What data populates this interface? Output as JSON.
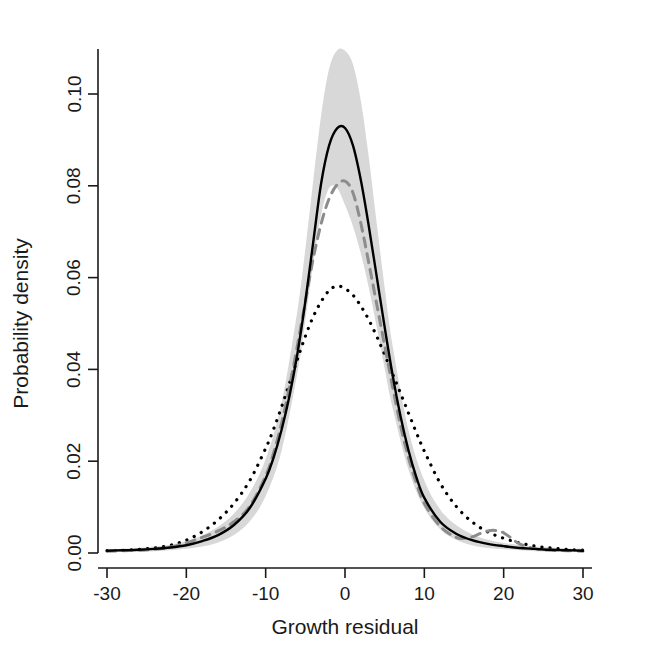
{
  "chart_data": {
    "type": "line",
    "title": "",
    "xlabel": "Growth residual",
    "ylabel": "Probability density",
    "xlim": [
      -31.5,
      31.5
    ],
    "ylim": [
      -0.0015,
      0.1125
    ],
    "xticks": [
      -30,
      -20,
      -10,
      0,
      10,
      20,
      30
    ],
    "xtick_labels": [
      "-30",
      "-20",
      "-10",
      "0",
      "10",
      "20",
      "30"
    ],
    "yticks": [
      0.0,
      0.02,
      0.04,
      0.06,
      0.08,
      0.1
    ],
    "ytick_labels": [
      "0.00",
      "0.02",
      "0.04",
      "0.06",
      "0.08",
      "0.10"
    ],
    "grid": false,
    "legend": "none",
    "colors": {
      "band": "#d8d8d8",
      "solid_line": "#000000",
      "dashed_line": "#8c8c8c",
      "dotted_line": "#000000",
      "axis": "#1a1a1a"
    },
    "series": [
      {
        "name": "confidence band upper",
        "style": "band-upper",
        "x": [
          -30,
          -28,
          -26,
          -24,
          -22,
          -20,
          -18,
          -16,
          -14,
          -12,
          -10,
          -8,
          -6,
          -5,
          -4,
          -3,
          -2,
          -1,
          0,
          1,
          2,
          3,
          4,
          5,
          6,
          8,
          10,
          12,
          14,
          16,
          18,
          20,
          22,
          24,
          26,
          28,
          30
        ],
        "values": [
          0.0008,
          0.0009,
          0.0011,
          0.0014,
          0.0018,
          0.0026,
          0.0038,
          0.0057,
          0.0086,
          0.0132,
          0.0205,
          0.0326,
          0.0528,
          0.0662,
          0.0812,
          0.0955,
          0.1055,
          0.1095,
          0.1094,
          0.1065,
          0.0985,
          0.0862,
          0.0718,
          0.0578,
          0.0452,
          0.0268,
          0.0158,
          0.0095,
          0.0061,
          0.0041,
          0.0029,
          0.0022,
          0.0017,
          0.0014,
          0.0012,
          0.001,
          0.0009
        ]
      },
      {
        "name": "confidence band lower",
        "style": "band-lower",
        "x": [
          -30,
          -28,
          -26,
          -24,
          -22,
          -20,
          -18,
          -16,
          -14,
          -12,
          -10,
          -8,
          -6,
          -5,
          -4,
          -3,
          -2,
          -1,
          0,
          1,
          2,
          3,
          4,
          5,
          6,
          8,
          10,
          12,
          14,
          16,
          18,
          20,
          22,
          24,
          26,
          28,
          30
        ],
        "values": [
          0.0002,
          0.0002,
          0.0003,
          0.0004,
          0.0006,
          0.0009,
          0.0014,
          0.0023,
          0.0039,
          0.0069,
          0.0124,
          0.0222,
          0.0392,
          0.0507,
          0.0632,
          0.0738,
          0.0795,
          0.0795,
          0.0758,
          0.0712,
          0.0652,
          0.0578,
          0.0492,
          0.0402,
          0.0316,
          0.0182,
          0.0098,
          0.0052,
          0.0029,
          0.0017,
          0.0011,
          0.0008,
          0.0006,
          0.0004,
          0.0003,
          0.0003,
          0.0002
        ]
      },
      {
        "name": "fitted density (solid)",
        "style": "solid",
        "x": [
          -30,
          -28,
          -26,
          -24,
          -22,
          -20,
          -18,
          -16,
          -14,
          -12,
          -10,
          -9,
          -8,
          -7,
          -6,
          -5,
          -4,
          -3,
          -2,
          -1,
          0,
          1,
          2,
          3,
          4,
          5,
          6,
          7,
          8,
          9,
          10,
          12,
          14,
          16,
          18,
          20,
          22,
          24,
          26,
          28,
          30
        ],
        "values": [
          0.0005,
          0.0006,
          0.0007,
          0.0009,
          0.0012,
          0.0017,
          0.0026,
          0.0039,
          0.0061,
          0.0098,
          0.0162,
          0.0208,
          0.0268,
          0.0342,
          0.0434,
          0.0548,
          0.0678,
          0.0806,
          0.0888,
          0.0925,
          0.0926,
          0.0888,
          0.0812,
          0.0712,
          0.0602,
          0.0492,
          0.0388,
          0.0298,
          0.0224,
          0.0165,
          0.012,
          0.0068,
          0.0042,
          0.0028,
          0.002,
          0.0015,
          0.0011,
          0.0009,
          0.0007,
          0.0006,
          0.0005
        ]
      },
      {
        "name": "empirical density (dashed)",
        "style": "dashed",
        "x": [
          -30,
          -28,
          -26,
          -24,
          -22,
          -20,
          -18,
          -16,
          -14,
          -12,
          -10,
          -9,
          -8,
          -7,
          -6,
          -5,
          -4,
          -3,
          -2,
          -1,
          0,
          1,
          2,
          3,
          4,
          5,
          6,
          7,
          8,
          9,
          10,
          12,
          14,
          15,
          16,
          17,
          18,
          19,
          20,
          21,
          22,
          24,
          26,
          28,
          30
        ],
        "values": [
          0.0004,
          0.0005,
          0.0006,
          0.0008,
          0.0013,
          0.0022,
          0.0034,
          0.0048,
          0.0068,
          0.0102,
          0.0168,
          0.0218,
          0.0282,
          0.0362,
          0.0452,
          0.0548,
          0.0642,
          0.0718,
          0.0772,
          0.0802,
          0.081,
          0.0785,
          0.0718,
          0.0632,
          0.0542,
          0.0452,
          0.0362,
          0.0278,
          0.0208,
          0.0152,
          0.0108,
          0.0058,
          0.0034,
          0.0032,
          0.0035,
          0.0042,
          0.0048,
          0.0049,
          0.0044,
          0.0032,
          0.002,
          0.0009,
          0.0006,
          0.0005,
          0.0004
        ]
      },
      {
        "name": "reference density (dotted)",
        "style": "dotted",
        "x": [
          -30,
          -28,
          -26,
          -24,
          -22,
          -20,
          -18,
          -16,
          -14,
          -12,
          -10,
          -9,
          -8,
          -7,
          -6,
          -5,
          -4,
          -3,
          -2,
          -1,
          0,
          1,
          2,
          3,
          4,
          5,
          6,
          7,
          8,
          9,
          10,
          12,
          14,
          16,
          18,
          20,
          22,
          24,
          26,
          28,
          30
        ],
        "values": [
          0.0005,
          0.0006,
          0.0008,
          0.0011,
          0.0017,
          0.0028,
          0.0046,
          0.0072,
          0.0108,
          0.0158,
          0.0228,
          0.027,
          0.0318,
          0.037,
          0.0422,
          0.0472,
          0.0515,
          0.0548,
          0.0572,
          0.0582,
          0.0576,
          0.0562,
          0.0538,
          0.0508,
          0.0472,
          0.0432,
          0.039,
          0.0348,
          0.0305,
          0.0262,
          0.0222,
          0.0152,
          0.0102,
          0.0068,
          0.0046,
          0.0032,
          0.0022,
          0.0015,
          0.0011,
          0.0008,
          0.0006
        ]
      }
    ]
  },
  "axes": {
    "x_title": "Growth residual",
    "y_title": "Probability density"
  }
}
